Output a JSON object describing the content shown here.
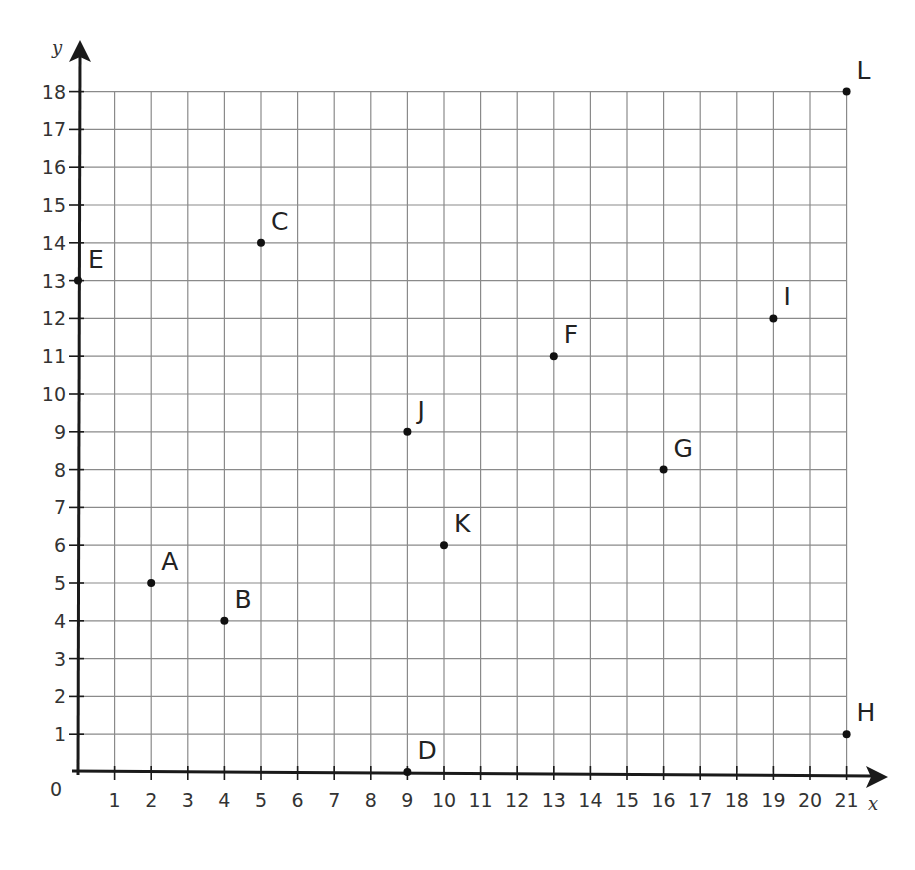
{
  "chart_data": {
    "type": "scatter",
    "title": "",
    "xlabel": "x",
    "ylabel": "y",
    "xlim": [
      0,
      21
    ],
    "ylim": [
      0,
      18
    ],
    "grid": true,
    "origin_label": "0",
    "x_ticks": [
      "1",
      "2",
      "3",
      "4",
      "5",
      "6",
      "7",
      "8",
      "9",
      "10",
      "11",
      "12",
      "13",
      "14",
      "15",
      "16",
      "17",
      "18",
      "19",
      "20",
      "21"
    ],
    "y_ticks": [
      "1",
      "2",
      "3",
      "4",
      "5",
      "6",
      "7",
      "8",
      "9",
      "10",
      "11",
      "12",
      "13",
      "14",
      "15",
      "16",
      "17",
      "18"
    ],
    "points": [
      {
        "label": "A",
        "x": 2,
        "y": 5
      },
      {
        "label": "B",
        "x": 4,
        "y": 4
      },
      {
        "label": "C",
        "x": 5,
        "y": 14
      },
      {
        "label": "D",
        "x": 9,
        "y": 0
      },
      {
        "label": "E",
        "x": 0,
        "y": 13
      },
      {
        "label": "F",
        "x": 13,
        "y": 11
      },
      {
        "label": "G",
        "x": 16,
        "y": 8
      },
      {
        "label": "H",
        "x": 21,
        "y": 1
      },
      {
        "label": "I",
        "x": 19,
        "y": 12
      },
      {
        "label": "J",
        "x": 9,
        "y": 9
      },
      {
        "label": "K",
        "x": 10,
        "y": 6
      },
      {
        "label": "L",
        "x": 21,
        "y": 18
      }
    ]
  },
  "colors": {
    "grid": "#8a8a8a",
    "axis": "#1a1a1a",
    "point": "#111111",
    "text": "#222222"
  }
}
